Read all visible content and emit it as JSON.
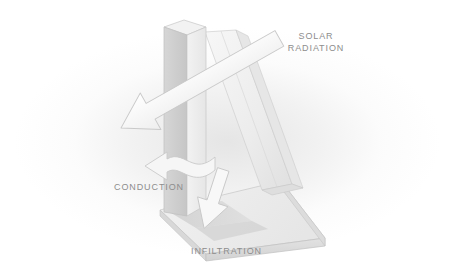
{
  "figure": {
    "kind": "architectural-heat-transfer-diagram",
    "background_color": "#ffffff",
    "haze_color": "#eeeeee",
    "label_color": "#8d8d8d"
  },
  "labels": {
    "solar": {
      "line1": "SOLAR",
      "line2": "RADIATION"
    },
    "conduction": "CONDUCTION",
    "infiltration": "INFILTRATION"
  },
  "structure": {
    "column_label": "vertical wall column",
    "roof_label": "sloping roof plane",
    "slab_label": "base floor slab",
    "face_light": "#f4f4f4",
    "face_mid": "#e4e4e4",
    "face_dark": "#cfcfcf",
    "edge_color": "#c2c2c2",
    "shadow_color": "#d2d2d2"
  },
  "arrows": {
    "solar": {
      "name": "solar-radiation-arrow",
      "direction": "down-left",
      "fill": "#fbfbfb",
      "stroke": "#c9c9c9"
    },
    "conduction": {
      "name": "conduction-arrow",
      "direction": "left",
      "fill": "#f6f6f6",
      "stroke": "#c9c9c9"
    },
    "infiltration": {
      "name": "infiltration-arrow",
      "direction": "down",
      "fill": "#f8f8f8",
      "stroke": "#c9c9c9"
    }
  }
}
